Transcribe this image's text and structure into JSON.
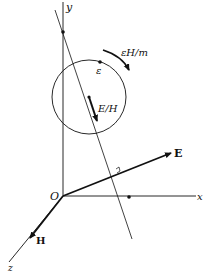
{
  "figure": {
    "type": "physics-vector-diagram",
    "labels": {
      "y_axis": "y",
      "x_axis": "x",
      "z_axis": "z",
      "origin": "O",
      "electric_field": "E",
      "magnetic_field": "H",
      "drift_velocity": "E/H",
      "angular_velocity": "εH/m",
      "charge": "ε"
    },
    "colors": {
      "stroke": "#111111",
      "background": "#ffffff"
    }
  }
}
